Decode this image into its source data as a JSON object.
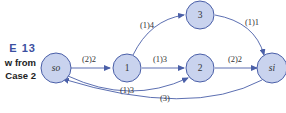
{
  "caption": {
    "figure_label": "E  13",
    "line2": "w from",
    "line3": "Case 2"
  },
  "colors": {
    "node_fill": "#c9d3ee",
    "node_stroke": "#4a5fa8",
    "edge": "#4a5fa8",
    "caption_accent": "#3b4fa0"
  },
  "nodes": [
    {
      "id": "so",
      "label": "so",
      "italic": true
    },
    {
      "id": "1",
      "label": "1",
      "italic": false
    },
    {
      "id": "2",
      "label": "2",
      "italic": false
    },
    {
      "id": "3",
      "label": "3",
      "italic": false
    },
    {
      "id": "si",
      "label": "si",
      "italic": true
    }
  ],
  "edges": [
    {
      "from": "so",
      "to": "1",
      "label": "(2)2"
    },
    {
      "from": "1",
      "to": "3",
      "label": "(1)4"
    },
    {
      "from": "1",
      "to": "2",
      "label": "(1)3"
    },
    {
      "from": "so",
      "to": "2",
      "label": "(1)3"
    },
    {
      "from": "3",
      "to": "si",
      "label": "(1)1"
    },
    {
      "from": "2",
      "to": "si",
      "label": "(2)2"
    },
    {
      "from": "si",
      "to": "so",
      "label": "(3)"
    }
  ]
}
